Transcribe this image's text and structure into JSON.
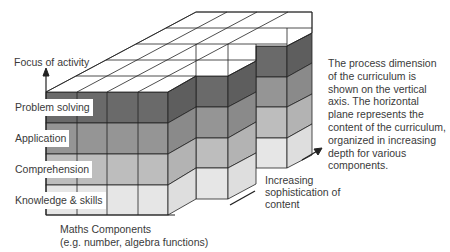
{
  "diagram": {
    "vertical_axis_label": "Focus of activity",
    "process_levels": [
      {
        "label": "Problem solving",
        "color": "#707070"
      },
      {
        "label": "Application",
        "color": "#9a9a9a"
      },
      {
        "label": "Comprehension",
        "color": "#c2c2c2"
      },
      {
        "label": "Knowledge & skills",
        "color": "#e8e8e8"
      }
    ],
    "horizontal_axis_label_line1": "Maths Components",
    "horizontal_axis_label_line2": "(e.g. number, algebra functions)",
    "depth_axis_label_line1": "Increasing",
    "depth_axis_label_line2": "sophistication of",
    "depth_axis_label_line3": "content",
    "caption": "The process dimension of the curriculum is shown on the vertical axis. The horizontal plane represents the content of the curriculum, organized in increasing depth for various components."
  }
}
